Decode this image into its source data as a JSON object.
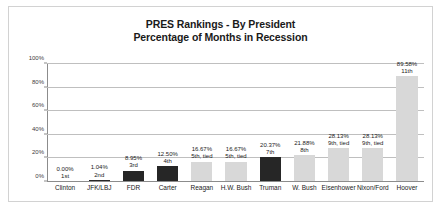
{
  "chart_data": {
    "type": "bar",
    "title": "PRES Rankings - By President",
    "subtitle": "Percentage of Months in Recession",
    "xlabel": "",
    "ylabel": "",
    "ylim": [
      0,
      100
    ],
    "grid": true,
    "legend": "none",
    "y_ticks": [
      "0%",
      "20%",
      "40%",
      "60%",
      "80%",
      "100%"
    ],
    "y_tick_values": [
      0,
      20,
      40,
      60,
      80,
      100
    ],
    "categories": [
      "Clinton",
      "JFK/LBJ",
      "FDR",
      "Carter",
      "Reagan",
      "H.W. Bush",
      "Truman",
      "W. Bush",
      "Eisenhower",
      "Nixon/Ford",
      "Hoover"
    ],
    "values": [
      0.0,
      1.04,
      8.95,
      12.5,
      16.67,
      16.67,
      20.37,
      21.88,
      28.13,
      28.13,
      89.58
    ],
    "value_labels": [
      "0.00%",
      "1.04%",
      "8.95%",
      "12.50%",
      "16.67%",
      "16.67%",
      "20.37%",
      "21.88%",
      "28.13%",
      "28.13%",
      "89.58%"
    ],
    "rank_labels": [
      "1st",
      "2nd",
      "3rd",
      "4th",
      "5th, tied",
      "5th, tied",
      "7th",
      "8th",
      "9th, tied",
      "9th, tied",
      "11th"
    ],
    "bar_colors": [
      "#262626",
      "#262626",
      "#262626",
      "#262626",
      "#d8d8d8",
      "#d8d8d8",
      "#262626",
      "#d8d8d8",
      "#d8d8d8",
      "#d8d8d8",
      "#d8d8d8"
    ],
    "colors": {
      "bar_light": "#d8d8d8",
      "bar_dark": "#262626",
      "gridline": "#bfbfbf",
      "axis": "#8c8c8c",
      "text": "#1a1a1a",
      "frame": "#d2d2d2",
      "background": "#ffffff"
    }
  }
}
